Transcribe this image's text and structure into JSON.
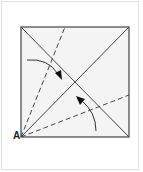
{
  "diagram": {
    "type": "origami-fold-diagram",
    "corner_label": "A",
    "colors": {
      "line": "#444444",
      "paper": "#f4f4f4",
      "frame": "#e2e2e2"
    },
    "square": {
      "x1": 21,
      "y1": 27,
      "x2": 129,
      "y2": 137
    },
    "elements": [
      {
        "kind": "diagonal",
        "style": "solid"
      },
      {
        "kind": "diagonal",
        "style": "solid"
      },
      {
        "kind": "valley-fold-line",
        "style": "dashed"
      },
      {
        "kind": "valley-fold-line",
        "style": "dashed"
      },
      {
        "kind": "fold-arrow",
        "direction": "down-right"
      },
      {
        "kind": "fold-arrow",
        "direction": "up-left"
      }
    ]
  }
}
